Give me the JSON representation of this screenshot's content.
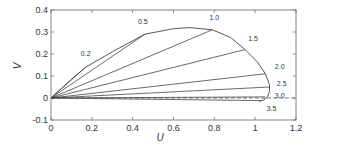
{
  "chart_data": {
    "type": "line",
    "title": "",
    "xlabel": "U",
    "ylabel": "V",
    "xlim": [
      0,
      1.2
    ],
    "ylim": [
      -0.1,
      0.4
    ],
    "xticks": [
      "0",
      "0.2",
      "0.4",
      "0.6",
      "0.8",
      "1",
      "1.2"
    ],
    "xtick_values": [
      0,
      0.2,
      0.4,
      0.6,
      0.8,
      1.0,
      1.2
    ],
    "yticks": [
      "-0.1",
      "0",
      "0.1",
      "0.2",
      "0.3",
      "0.4"
    ],
    "ytick_values": [
      -0.1,
      0,
      0.1,
      0.2,
      0.3,
      0.4
    ],
    "grid": false,
    "envelope": {
      "name": "envelope",
      "x": [
        0,
        0.1,
        0.17,
        0.3,
        0.46,
        0.6,
        0.68,
        0.79,
        0.88,
        0.95,
        1.01,
        1.05,
        1.07,
        1.07,
        1.06,
        1.04,
        1.02
      ],
      "y": [
        0,
        0.085,
        0.14,
        0.21,
        0.29,
        0.315,
        0.32,
        0.31,
        0.275,
        0.22,
        0.165,
        0.11,
        0.06,
        0.03,
        0.005,
        -0.01,
        -0.015
      ]
    },
    "rays": [
      {
        "label": "0.2",
        "end": [
          0.17,
          0.14
        ]
      },
      {
        "label": "0.5",
        "end": [
          0.46,
          0.29
        ]
      },
      {
        "label": "1.0",
        "end": [
          0.79,
          0.31
        ]
      },
      {
        "label": "1.5",
        "end": [
          0.95,
          0.22
        ]
      },
      {
        "label": "2.0",
        "end": [
          1.05,
          0.11
        ]
      },
      {
        "label": "2.5",
        "end": [
          1.07,
          0.05
        ]
      },
      {
        "label": "3.0",
        "end": [
          1.05,
          0.005
        ]
      },
      {
        "label": "3.5",
        "end": [
          1.03,
          -0.012
        ]
      }
    ],
    "dashed_reference": {
      "y": 0,
      "x_range": [
        0,
        1.2
      ]
    },
    "ray_label_positions": [
      {
        "label": "0.2",
        "at": [
          0.17,
          0.19
        ]
      },
      {
        "label": "0.5",
        "at": [
          0.45,
          0.335
        ]
      },
      {
        "label": "1.0",
        "at": [
          0.8,
          0.355
        ]
      },
      {
        "label": "1.5",
        "at": [
          0.99,
          0.26
        ]
      },
      {
        "label": "2.0",
        "at": [
          1.12,
          0.13
        ]
      },
      {
        "label": "2.5",
        "at": [
          1.13,
          0.055
        ]
      },
      {
        "label": "3.0",
        "at": [
          1.12,
          0.0
        ]
      },
      {
        "label": "3.5",
        "at": [
          1.08,
          -0.06
        ]
      }
    ]
  }
}
